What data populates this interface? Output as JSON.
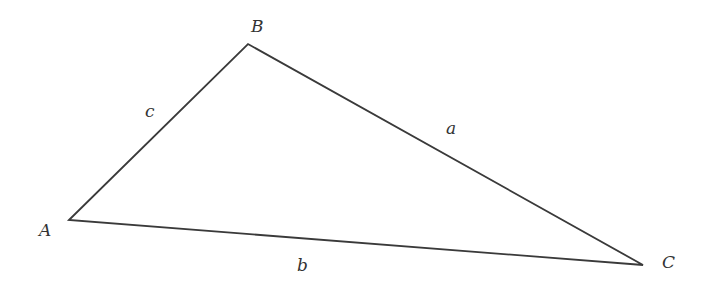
{
  "diagram": {
    "type": "triangle",
    "stroke_color": "#3a3a3a",
    "background": "#ffffff",
    "vertices": [
      {
        "name": "A",
        "label": "A",
        "x": 69,
        "y": 220,
        "label_x": 39,
        "label_y": 236
      },
      {
        "name": "B",
        "label": "B",
        "x": 248,
        "y": 44,
        "label_x": 251,
        "label_y": 32
      },
      {
        "name": "C",
        "label": "C",
        "x": 643,
        "y": 265,
        "label_x": 662,
        "label_y": 268
      }
    ],
    "sides": [
      {
        "name": "a",
        "label": "a",
        "from": "B",
        "to": "C",
        "label_x": 446,
        "label_y": 134
      },
      {
        "name": "b",
        "label": "b",
        "from": "A",
        "to": "C",
        "label_x": 297,
        "label_y": 271
      },
      {
        "name": "c",
        "label": "c",
        "from": "A",
        "to": "B",
        "label_x": 145,
        "label_y": 117
      }
    ]
  }
}
